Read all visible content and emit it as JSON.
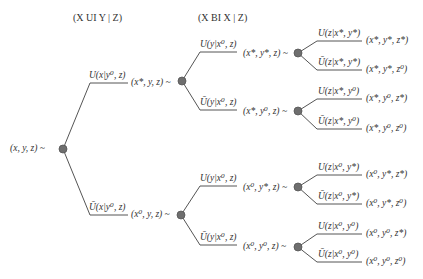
{
  "headers": {
    "left": "(X UI Y | Z)",
    "right": "(X BI X | Z)"
  },
  "colors": {
    "line": "#555555",
    "node_fill": "#6e6e6e",
    "node_stroke": "#555555",
    "text": "#333333"
  },
  "root": {
    "label": "(x, y, z) ~"
  },
  "level1": [
    {
      "edge": "U(x|y⁰, z)",
      "state": "(x*, y, z) ~"
    },
    {
      "edge": "Ū(x|y⁰, z)",
      "state": "(x⁰, y, z) ~"
    }
  ],
  "level2": [
    {
      "edge": "U(y|x⁰, z)",
      "state": "(x*, y*, z) ~"
    },
    {
      "edge": "Ū(y|x⁰, z)",
      "state": "(x*, y⁰, z) ~"
    },
    {
      "edge": "U(y|x⁰, z)",
      "state": "(x⁰, y*, z) ~"
    },
    {
      "edge": "Ū(y|x⁰, z)",
      "state": "(x⁰, y⁰, z) ~"
    }
  ],
  "level3": [
    {
      "edge": "U(z|x*, y*)",
      "state": "(x*, y*, z*)"
    },
    {
      "edge": "Ū(z|x*, y*)",
      "state": "(x*, y*, z⁰)"
    },
    {
      "edge": "U(z|x*, y⁰)",
      "state": "(x*, y⁰, z*)"
    },
    {
      "edge": "Ū(z|x*, y⁰)",
      "state": "(x*, y⁰, z⁰)"
    },
    {
      "edge": "U(z|x⁰, y*)",
      "state": "(x⁰, y*, z*)"
    },
    {
      "edge": "Ū(z|x⁰, y*)",
      "state": "(x⁰, y*, z⁰)"
    },
    {
      "edge": "U(z|x⁰, y⁰)",
      "state": "(x⁰, y⁰, z*)"
    },
    {
      "edge": "Ū(z|x⁰, y⁰)",
      "state": "(x⁰, y⁰, z⁰)"
    }
  ]
}
